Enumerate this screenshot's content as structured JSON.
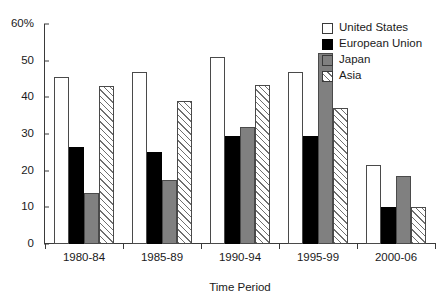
{
  "chart_data": {
    "type": "bar",
    "title": "",
    "xlabel": "Time Period",
    "ylabel": "",
    "categories": [
      "1980-84",
      "1985-89",
      "1990-94",
      "1995-99",
      "2000-06"
    ],
    "series": [
      {
        "name": "United States",
        "values": [
          45.5,
          47.0,
          51.0,
          47.0,
          21.5
        ]
      },
      {
        "name": "European Union",
        "values": [
          26.5,
          25.0,
          29.5,
          29.5,
          10.0
        ]
      },
      {
        "name": "Japan",
        "values": [
          14.0,
          17.5,
          32.0,
          52.0,
          18.5
        ]
      },
      {
        "name": "Asia",
        "values": [
          43.0,
          39.0,
          43.5,
          37.0,
          10.0
        ]
      }
    ],
    "ylim": [
      0,
      60
    ],
    "y_ticks": [
      0,
      10,
      20,
      30,
      40,
      50,
      60
    ],
    "y_tick_labels": [
      "0",
      "10",
      "20",
      "30",
      "40",
      "50",
      "60%"
    ],
    "grid": false,
    "legend_position": "top-right"
  },
  "legend": {
    "items": [
      {
        "label": "United States",
        "swatch": "white-outline-swatch",
        "color": "#ffffff"
      },
      {
        "label": "European Union",
        "swatch": "solid-black-swatch",
        "color": "#000000"
      },
      {
        "label": "Japan",
        "swatch": "gray-swatch",
        "color": "#808080"
      },
      {
        "label": "Asia",
        "swatch": "hatched-swatch",
        "color": "#6f6f6f"
      }
    ]
  },
  "axes": {
    "x_title": "Time Period"
  }
}
